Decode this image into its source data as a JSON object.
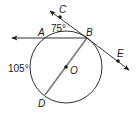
{
  "diagram": {
    "type": "circle-geometry",
    "points": {
      "A": "A",
      "B": "B",
      "C": "C",
      "D": "D",
      "E": "E",
      "O": "O"
    },
    "angle_labels": {
      "arc_AB": "75°",
      "arc_AD": "105°"
    },
    "elements": {
      "circle_center": "O",
      "diameter": "BD",
      "secant_ray": "BA",
      "tangent_line": "CE"
    },
    "colors": {
      "stroke": "#1a1a1a",
      "diameter": "#7a7a7a",
      "background": "#ffffff"
    }
  }
}
